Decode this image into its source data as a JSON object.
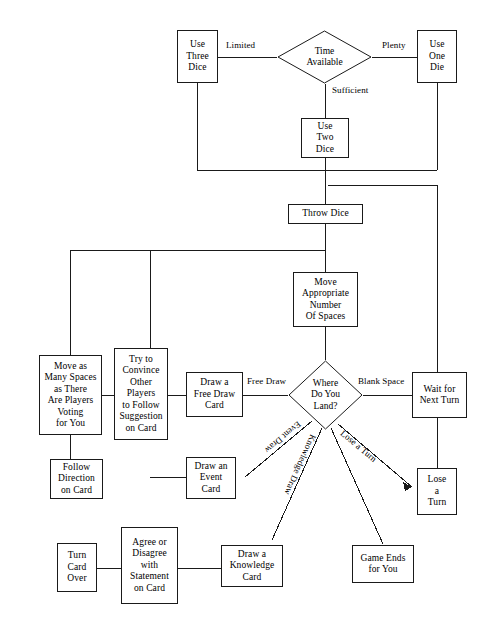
{
  "diagram": {
    "type": "flowchart",
    "background_color": "#ffffff",
    "line_color": "#1a1a1a",
    "text_color": "#000000"
  },
  "nodes": {
    "time_available": "Time\nAvailable",
    "use_three_dice": "Use\nThree\nDice",
    "use_one_die": "Use\nOne\nDie",
    "use_two_dice": "Use\nTwo\nDice",
    "throw_dice": "Throw Dice",
    "move_spaces": "Move\nAppropriate\nNumber\nOf Spaces",
    "where_land": "Where\nDo You\nLand?",
    "draw_free_draw_card": "Draw a\nFree Draw\nCard",
    "convince_players": "Try to\nConvince\nOther\nPlayers\nto Follow\nSuggestion\non Card",
    "move_many_spaces": "Move as\nMany Spaces\nas There\nAre Players\nVoting\nfor You",
    "draw_event_card": "Draw an\nEvent\nCard",
    "follow_direction": "Follow\nDirection\non Card",
    "draw_knowledge_card": "Draw a\nKnowledge\nCard",
    "agree_disagree": "Agree or\nDisagree\nwith\nStatement\non Card",
    "turn_card_over": "Turn\nCard\nOver",
    "wait_next_turn": "Wait for\nNext Turn",
    "lose_a_turn": "Lose\na\nTurn",
    "game_ends": "Game Ends\nfor You"
  },
  "edge_labels": {
    "limited": "Limited",
    "plenty": "Plenty",
    "sufficient": "Sufficient",
    "free_draw": "Free Draw",
    "blank_space": "Blank Space",
    "event_draw": "Event Draw",
    "knowledge_draw": "Knowledge Draw",
    "lose_turn": "Lose a Turn"
  }
}
